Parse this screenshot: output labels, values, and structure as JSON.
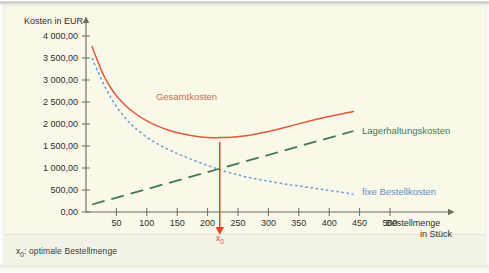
{
  "figure": {
    "footer_note_prefix": "x",
    "footer_note_sub": "0",
    "footer_note_text": ": optimale Bestellmenge"
  },
  "chart_data": {
    "type": "line",
    "title": "",
    "ylabel": "Kosten in EUR",
    "xlabel_line1": "Bestellmenge",
    "xlabel_line2": "in Stück",
    "grid": false,
    "legend_position": "inline-annotations",
    "xlim": [
      0,
      520
    ],
    "ylim": [
      0,
      4000
    ],
    "yticks": [
      0,
      500,
      1000,
      1500,
      2000,
      2500,
      3000,
      3500,
      4000
    ],
    "ytick_labels": [
      "0,00",
      "500,00",
      "1 000,00",
      "1 500,00",
      "2 000,00",
      "2 500,00",
      "3 000,00",
      "3 500,00",
      "4 000,00"
    ],
    "xticks": [
      50,
      100,
      150,
      200,
      250,
      300,
      350,
      400,
      450,
      500
    ],
    "xtick_labels": [
      "50",
      "100",
      "150",
      "200",
      "250",
      "300",
      "350",
      "400",
      "450",
      "500"
    ],
    "annotations": [
      {
        "name": "optimum-marker",
        "label": "x",
        "sub": "0",
        "x": 220,
        "y": 0,
        "color": "#e8402a"
      }
    ],
    "series": [
      {
        "name": "Gesamtkosten",
        "label": "Gesamtkosten",
        "color": "#e0593c",
        "style": "solid",
        "label_x": 115,
        "label_y": 2550,
        "points": [
          [
            10,
            3760
          ],
          [
            20,
            3400
          ],
          [
            30,
            3080
          ],
          [
            40,
            2840
          ],
          [
            50,
            2640
          ],
          [
            65,
            2420
          ],
          [
            80,
            2250
          ],
          [
            100,
            2070
          ],
          [
            120,
            1940
          ],
          [
            140,
            1840
          ],
          [
            160,
            1770
          ],
          [
            180,
            1720
          ],
          [
            200,
            1695
          ],
          [
            220,
            1690
          ],
          [
            240,
            1700
          ],
          [
            260,
            1730
          ],
          [
            280,
            1775
          ],
          [
            300,
            1830
          ],
          [
            330,
            1930
          ],
          [
            360,
            2040
          ],
          [
            390,
            2140
          ],
          [
            420,
            2230
          ],
          [
            440,
            2285
          ]
        ]
      },
      {
        "name": "fixe Bestellkosten",
        "label": "fixe Bestellkosten",
        "color": "#6a9fd4",
        "style": "dotted",
        "label_x": 460,
        "label_y": 390,
        "points": [
          [
            10,
            3500
          ],
          [
            20,
            3180
          ],
          [
            30,
            2880
          ],
          [
            40,
            2620
          ],
          [
            50,
            2400
          ],
          [
            65,
            2130
          ],
          [
            80,
            1920
          ],
          [
            100,
            1700
          ],
          [
            120,
            1530
          ],
          [
            140,
            1390
          ],
          [
            160,
            1270
          ],
          [
            180,
            1160
          ],
          [
            200,
            1060
          ],
          [
            220,
            960
          ],
          [
            240,
            880
          ],
          [
            260,
            810
          ],
          [
            280,
            750
          ],
          [
            300,
            700
          ],
          [
            330,
            630
          ],
          [
            360,
            570
          ],
          [
            390,
            510
          ],
          [
            420,
            450
          ],
          [
            440,
            400
          ]
        ]
      },
      {
        "name": "Lagerhaltungskosten",
        "label": "Lagerhaltungskosten",
        "color": "#3f7a4e",
        "style": "dashed",
        "label_x": 460,
        "label_y": 1780,
        "points": [
          [
            10,
            170
          ],
          [
            440,
            1840
          ]
        ]
      }
    ]
  }
}
